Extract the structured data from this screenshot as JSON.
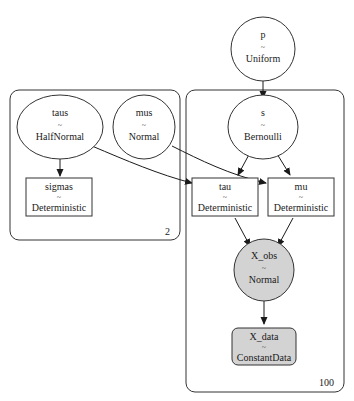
{
  "graph": {
    "type": "pymc-model-graph",
    "plates": [
      {
        "id": "plate-2",
        "label": "2",
        "nodes": [
          "taus",
          "mus",
          "sigmas"
        ]
      },
      {
        "id": "plate-100",
        "label": "100",
        "nodes": [
          "s",
          "tau",
          "mu",
          "X_obs",
          "X_data"
        ]
      }
    ],
    "nodes": {
      "p": {
        "name": "p",
        "sep": "~",
        "dist": "Uniform",
        "shape": "ellipse",
        "fill": "#ffffff"
      },
      "taus": {
        "name": "taus",
        "sep": "~",
        "dist": "HalfNormal",
        "shape": "ellipse",
        "fill": "#ffffff"
      },
      "mus": {
        "name": "mus",
        "sep": "~",
        "dist": "Normal",
        "shape": "ellipse",
        "fill": "#ffffff"
      },
      "sigmas": {
        "name": "sigmas",
        "sep": "~",
        "dist": "Deterministic",
        "shape": "box",
        "fill": "#ffffff"
      },
      "s": {
        "name": "s",
        "sep": "~",
        "dist": "Bernoulli",
        "shape": "ellipse",
        "fill": "#ffffff"
      },
      "tau": {
        "name": "tau",
        "sep": "~",
        "dist": "Deterministic",
        "shape": "box",
        "fill": "#ffffff"
      },
      "mu": {
        "name": "mu",
        "sep": "~",
        "dist": "Deterministic",
        "shape": "box",
        "fill": "#ffffff"
      },
      "X_obs": {
        "name": "X_obs",
        "sep": "~",
        "dist": "Normal",
        "shape": "ellipse",
        "fill": "#d3d3d3"
      },
      "X_data": {
        "name": "X_data",
        "sep": "~",
        "dist": "ConstantData",
        "shape": "rounded-box",
        "fill": "#d3d3d3"
      }
    },
    "edges": [
      {
        "from": "p",
        "to": "s"
      },
      {
        "from": "taus",
        "to": "sigmas"
      },
      {
        "from": "taus",
        "to": "tau"
      },
      {
        "from": "mus",
        "to": "mu"
      },
      {
        "from": "s",
        "to": "tau"
      },
      {
        "from": "s",
        "to": "mu"
      },
      {
        "from": "tau",
        "to": "X_obs"
      },
      {
        "from": "mu",
        "to": "X_obs"
      },
      {
        "from": "X_obs",
        "to": "X_data"
      }
    ]
  },
  "colors": {
    "stroke": "#333333",
    "observed_fill": "#d3d3d3",
    "background": "#ffffff"
  }
}
